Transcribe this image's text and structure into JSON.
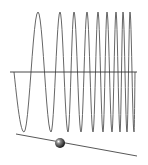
{
  "diagram": {
    "background": "#ffffff",
    "stroke_color": "#555555",
    "axis": {
      "x1": 10,
      "x2": 137,
      "y": 72,
      "color": "#333333"
    },
    "wave": {
      "type": "chirp",
      "x_start": 14,
      "x_end": 135,
      "baseline_y": 72,
      "amplitude": 60,
      "start_phase": "downward",
      "peak_x": [
        38,
        60,
        74,
        87,
        98,
        107,
        116,
        123,
        130
      ],
      "trough_x": [
        24,
        51,
        68,
        81,
        93,
        103,
        112,
        120,
        127,
        134
      ]
    },
    "slider": {
      "track": {
        "x1": 16,
        "y1": 134,
        "x2": 137,
        "y2": 156,
        "color": "#444444"
      },
      "knob": {
        "cx": 60,
        "cy": 143,
        "r": 5,
        "color": "#222222"
      }
    }
  }
}
